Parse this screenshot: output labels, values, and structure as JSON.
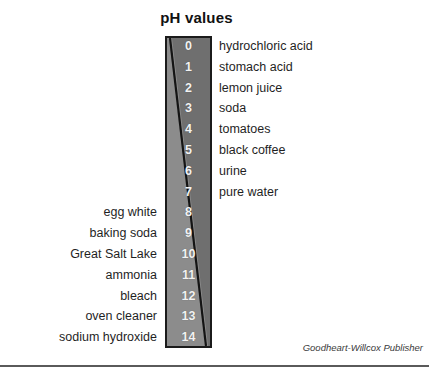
{
  "title": "pH values",
  "credit": "Goodheart-Willcox Publisher",
  "colors": {
    "bar_border": "#1b1b1b",
    "bar_light_gray": "#9a9a9a",
    "bar_dark_gray": "#6f6f6f",
    "diagonal_line": "#141414",
    "number_text": "#f2f2f2",
    "label_text": "#1f1f1f",
    "rule": "#5a5a5a",
    "background": "#ffffff"
  },
  "chart_data": {
    "type": "table",
    "title": "pH values",
    "xlabel": "",
    "ylabel": "pH",
    "categories": [
      "0",
      "1",
      "2",
      "3",
      "4",
      "5",
      "6",
      "7",
      "8",
      "9",
      "10",
      "11",
      "12",
      "13",
      "14"
    ],
    "values": [
      0,
      1,
      2,
      3,
      4,
      5,
      6,
      7,
      8,
      9,
      10,
      11,
      12,
      13,
      14
    ],
    "ylim": [
      0,
      14
    ],
    "grid": false,
    "legend": "none",
    "annotations": [
      "Acidic substances listed on the right from pH 0 to 7",
      "Basic substances listed on the left from pH 8 to 14",
      "Diagonal divider runs from top-left to bottom-right of the bar"
    ],
    "rows": [
      {
        "ph": "0",
        "left": "",
        "right": "hydrochloric acid"
      },
      {
        "ph": "1",
        "left": "",
        "right": "stomach acid"
      },
      {
        "ph": "2",
        "left": "",
        "right": "lemon juice"
      },
      {
        "ph": "3",
        "left": "",
        "right": "soda"
      },
      {
        "ph": "4",
        "left": "",
        "right": "tomatoes"
      },
      {
        "ph": "5",
        "left": "",
        "right": "black coffee"
      },
      {
        "ph": "6",
        "left": "",
        "right": "urine"
      },
      {
        "ph": "7",
        "left": "",
        "right": "pure water"
      },
      {
        "ph": "8",
        "left": "egg white",
        "right": ""
      },
      {
        "ph": "9",
        "left": "baking soda",
        "right": ""
      },
      {
        "ph": "10",
        "left": "Great Salt Lake",
        "right": ""
      },
      {
        "ph": "11",
        "left": "ammonia",
        "right": ""
      },
      {
        "ph": "12",
        "left": "bleach",
        "right": ""
      },
      {
        "ph": "13",
        "left": "oven cleaner",
        "right": ""
      },
      {
        "ph": "14",
        "left": "sodium hydroxide",
        "right": ""
      }
    ]
  }
}
